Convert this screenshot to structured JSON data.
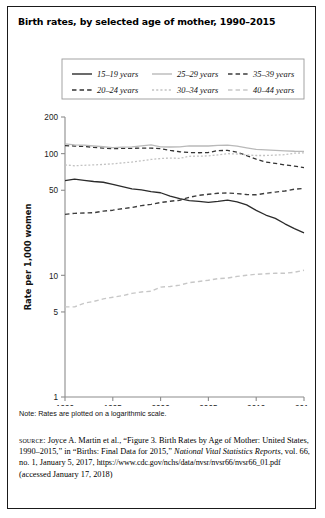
{
  "figure": {
    "title": "Birth rates, by selected age of mother, 1990–2015",
    "note": "Note: Rates are plotted on a logarithmic scale.",
    "source": {
      "label": "source:",
      "line1": " Joyce A. Martin et al., “Figure 3. Birth Rates by Age of",
      "line2": "Mother: United States, 1990–2015,” in “Births: Final Data for 2015,”",
      "journal": "National Vital Statistics Reports",
      "line3": ", vol. 66, no. 1, January 5, 2017,",
      "url": "https://www.cdc.gov/nchs/data/nvsr/nvsr66/nvsr66_01.pdf",
      "accessed": "(accessed January 17, 2018)"
    }
  },
  "chart_data": {
    "type": "line",
    "title": "Birth rates, by selected age of mother, 1990–2015",
    "xlabel": "",
    "ylabel": "Rate per 1,000 women",
    "yscale": "log",
    "ylim": [
      1,
      200
    ],
    "xlim": [
      1990,
      2015
    ],
    "grid": false,
    "legend_position": "top",
    "ytick_labels": [
      "200",
      "100",
      "50",
      "10",
      "5",
      "1"
    ],
    "ytick_values": [
      200,
      100,
      50,
      10,
      5,
      1
    ],
    "xtick_labels": [
      "1990",
      "1995",
      "2000",
      "2005",
      "2010",
      "2015"
    ],
    "xtick_values": [
      1990,
      1995,
      2000,
      2005,
      2010,
      2015
    ],
    "x": [
      1990,
      1991,
      1992,
      1993,
      1994,
      1995,
      1996,
      1997,
      1998,
      1999,
      2000,
      2001,
      2002,
      2003,
      2004,
      2005,
      2006,
      2007,
      2008,
      2009,
      2010,
      2011,
      2012,
      2013,
      2014,
      2015
    ],
    "series": [
      {
        "name": "15–19 years",
        "style": "solid",
        "color": "#2b2b2b",
        "width": 1.3,
        "values": [
          59.9,
          61.8,
          60.3,
          59.0,
          58.2,
          56.0,
          53.5,
          51.3,
          50.3,
          48.8,
          47.7,
          44.8,
          42.6,
          41.1,
          40.5,
          39.7,
          40.5,
          41.5,
          40.2,
          37.9,
          34.2,
          31.3,
          29.4,
          26.5,
          24.2,
          22.3
        ]
      },
      {
        "name": "20–24 years",
        "style": "dashed",
        "color": "#333333",
        "width": 1.3,
        "values": [
          116.5,
          115.3,
          114.6,
          112.6,
          111.1,
          109.8,
          110.4,
          110.4,
          111.2,
          111.0,
          109.7,
          106.2,
          103.6,
          102.1,
          101.7,
          102.2,
          105.9,
          106.3,
          103.0,
          96.3,
          90.0,
          85.3,
          83.1,
          80.7,
          79.0,
          76.8
        ]
      },
      {
        "name": "25–29 years",
        "style": "solid",
        "color": "#b9b9b9",
        "width": 1.3,
        "values": [
          120.2,
          118.2,
          117.4,
          115.5,
          113.9,
          112.2,
          113.1,
          113.8,
          115.9,
          117.8,
          113.5,
          113.4,
          113.6,
          115.6,
          115.5,
          115.5,
          116.8,
          117.5,
          115.1,
          111.5,
          108.3,
          107.2,
          106.5,
          105.5,
          104.6,
          104.3
        ]
      },
      {
        "name": "30–34 years",
        "style": "dotted",
        "color": "#c2c2c2",
        "width": 1.3,
        "values": [
          80.8,
          79.5,
          80.2,
          80.8,
          81.5,
          82.5,
          83.9,
          85.3,
          87.4,
          89.6,
          91.2,
          91.9,
          91.5,
          95.1,
          95.3,
          95.8,
          97.7,
          99.9,
          99.3,
          97.5,
          96.5,
          96.5,
          97.3,
          98.0,
          100.8,
          101.5
        ]
      },
      {
        "name": "35–39 years",
        "style": "dashed",
        "color": "#3d3d3d",
        "width": 1.4,
        "values": [
          31.7,
          32.3,
          32.5,
          32.7,
          33.7,
          34.3,
          35.3,
          36.1,
          37.4,
          38.3,
          39.7,
          40.6,
          41.4,
          43.8,
          45.4,
          46.3,
          47.3,
          47.5,
          46.9,
          46.1,
          45.9,
          47.2,
          48.3,
          49.3,
          51.0,
          51.8
        ]
      },
      {
        "name": "40–44 years",
        "style": "dashed",
        "color": "#c7c7c7",
        "width": 1.4,
        "values": [
          5.5,
          5.5,
          5.9,
          6.1,
          6.4,
          6.6,
          6.8,
          7.1,
          7.3,
          7.4,
          8.0,
          8.1,
          8.3,
          8.7,
          8.9,
          9.1,
          9.4,
          9.5,
          9.8,
          10.0,
          10.2,
          10.3,
          10.4,
          10.4,
          10.6,
          11.0
        ]
      }
    ]
  },
  "legend": {
    "entries": [
      {
        "label": "15–19 years",
        "style": "solid",
        "color": "#2b2b2b"
      },
      {
        "label": "25–29 years",
        "style": "solid",
        "color": "#b9b9b9"
      },
      {
        "label": "35–39 years",
        "style": "dashed",
        "color": "#3d3d3d"
      },
      {
        "label": "20–24 years",
        "style": "dashed",
        "color": "#333333"
      },
      {
        "label": "30–34 years",
        "style": "dotted",
        "color": "#c2c2c2"
      },
      {
        "label": "40–44 years",
        "style": "dashed",
        "color": "#c7c7c7"
      }
    ]
  }
}
